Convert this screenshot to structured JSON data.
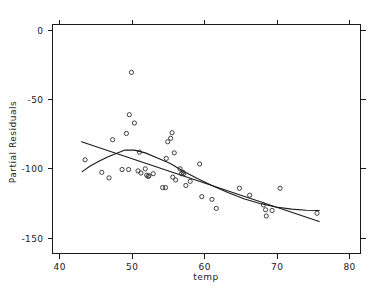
{
  "chart_data": {
    "type": "scatter",
    "title": "",
    "xlabel": "temp",
    "ylabel": "Partial Residuals",
    "xlim": [
      39.0,
      81.5
    ],
    "ylim": [
      -161.0,
      4.0
    ],
    "xticks": [
      40,
      50,
      60,
      70,
      80
    ],
    "xticklabels": [
      "40",
      "50",
      "60",
      "70",
      "80"
    ],
    "yticks": [
      0,
      -50,
      -100,
      -150
    ],
    "yticklabels": [
      "0",
      "-50",
      "-100",
      "-150"
    ],
    "grid": false,
    "legend": null,
    "frame": "box-with-outward-ticks-all-sides",
    "marker": "open-circle",
    "points": [
      {
        "x": 43.5,
        "y": -93.5
      },
      {
        "x": 45.8,
        "y": -102.5
      },
      {
        "x": 46.8,
        "y": -106.5
      },
      {
        "x": 47.3,
        "y": -79.0
      },
      {
        "x": 48.6,
        "y": -100.5
      },
      {
        "x": 49.2,
        "y": -74.5
      },
      {
        "x": 49.5,
        "y": -100.5
      },
      {
        "x": 49.6,
        "y": -61.0
      },
      {
        "x": 49.9,
        "y": -30.5
      },
      {
        "x": 50.3,
        "y": -67.0
      },
      {
        "x": 50.8,
        "y": -101.5
      },
      {
        "x": 51.0,
        "y": -88.0
      },
      {
        "x": 51.2,
        "y": -103.0
      },
      {
        "x": 51.8,
        "y": -100.0
      },
      {
        "x": 52.0,
        "y": -104.5
      },
      {
        "x": 52.2,
        "y": -105.5
      },
      {
        "x": 52.3,
        "y": -105.0
      },
      {
        "x": 52.9,
        "y": -103.5
      },
      {
        "x": 54.2,
        "y": -113.5
      },
      {
        "x": 54.6,
        "y": -113.5
      },
      {
        "x": 54.7,
        "y": -92.5
      },
      {
        "x": 54.9,
        "y": -80.5
      },
      {
        "x": 55.3,
        "y": -78.0
      },
      {
        "x": 55.5,
        "y": -74.0
      },
      {
        "x": 55.6,
        "y": -106.0
      },
      {
        "x": 55.8,
        "y": -88.5
      },
      {
        "x": 56.0,
        "y": -108.0
      },
      {
        "x": 56.6,
        "y": -100.0
      },
      {
        "x": 56.8,
        "y": -103.5
      },
      {
        "x": 57.0,
        "y": -102.5
      },
      {
        "x": 57.1,
        "y": -103.5
      },
      {
        "x": 57.4,
        "y": -112.0
      },
      {
        "x": 58.0,
        "y": -109.0
      },
      {
        "x": 59.3,
        "y": -96.5
      },
      {
        "x": 59.6,
        "y": -120.0
      },
      {
        "x": 61.0,
        "y": -122.0
      },
      {
        "x": 61.6,
        "y": -128.5
      },
      {
        "x": 64.8,
        "y": -114.0
      },
      {
        "x": 66.2,
        "y": -119.0
      },
      {
        "x": 68.1,
        "y": -126.0
      },
      {
        "x": 68.4,
        "y": -129.5
      },
      {
        "x": 68.5,
        "y": -134.0
      },
      {
        "x": 69.3,
        "y": -130.0
      },
      {
        "x": 70.4,
        "y": -114.0
      },
      {
        "x": 75.5,
        "y": -132.0
      }
    ],
    "series": [
      {
        "name": "linear-fit",
        "type": "line",
        "x": [
          43.0,
          75.8
        ],
        "y": [
          -80.5,
          -138.0
        ]
      },
      {
        "name": "loess-smoother",
        "type": "line",
        "x": [
          43.1,
          44.2,
          45.4,
          46.6,
          47.8,
          49.0,
          50.3,
          51.8,
          53.4,
          55.2,
          57.0,
          59.0,
          61.0,
          63.2,
          65.4,
          67.6,
          69.8,
          72.0,
          74.0,
          75.8
        ],
        "y": [
          -102.0,
          -98.0,
          -94.5,
          -91.5,
          -89.0,
          -86.5,
          -86.5,
          -88.5,
          -92.0,
          -96.0,
          -101.5,
          -107.0,
          -112.0,
          -117.0,
          -121.5,
          -125.0,
          -127.5,
          -129.0,
          -129.8,
          -130.0
        ]
      }
    ]
  }
}
